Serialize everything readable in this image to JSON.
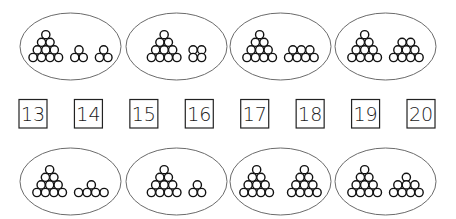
{
  "worksheet": {
    "task": "match-quantity-to-number",
    "colors": {
      "outline": "#6b6b6b",
      "circle_stroke": "#111111",
      "box_stroke": "#222222",
      "text": "#1a1a1a"
    },
    "numbers": [
      "13",
      "14",
      "15",
      "16",
      "17",
      "18",
      "19",
      "20"
    ],
    "top_sets": [
      {
        "total": 16,
        "groups": [
          {
            "shape": "triangle",
            "rows": [
              1,
              2,
              3,
              4
            ]
          },
          {
            "shape": "cluster",
            "rows": [
              1,
              2
            ]
          },
          {
            "shape": "cluster",
            "rows": [
              1,
              2
            ]
          }
        ]
      },
      {
        "total": 14,
        "groups": [
          {
            "shape": "triangle",
            "rows": [
              1,
              2,
              3,
              4
            ]
          },
          {
            "shape": "grid",
            "rows": [
              2,
              2
            ]
          }
        ]
      },
      {
        "total": 17,
        "groups": [
          {
            "shape": "triangle",
            "rows": [
              1,
              2,
              3,
              4
            ]
          },
          {
            "shape": "cluster",
            "rows": [
              3,
              4
            ]
          }
        ]
      },
      {
        "total": 19,
        "groups": [
          {
            "shape": "triangle",
            "rows": [
              1,
              2,
              3,
              4
            ]
          },
          {
            "shape": "cluster",
            "rows": [
              2,
              3,
              4
            ]
          }
        ]
      }
    ],
    "bottom_sets": [
      {
        "total": 15,
        "groups": [
          {
            "shape": "triangle",
            "rows": [
              1,
              2,
              3,
              4
            ]
          },
          {
            "shape": "cluster",
            "rows": [
              1,
              4
            ]
          }
        ]
      },
      {
        "total": 13,
        "groups": [
          {
            "shape": "triangle",
            "rows": [
              1,
              2,
              3,
              4
            ]
          },
          {
            "shape": "cluster",
            "rows": [
              1,
              2
            ]
          }
        ]
      },
      {
        "total": 20,
        "groups": [
          {
            "shape": "triangle",
            "rows": [
              1,
              2,
              3,
              4
            ]
          },
          {
            "shape": "triangle",
            "rows": [
              1,
              2,
              3,
              4
            ]
          }
        ]
      },
      {
        "total": 18,
        "groups": [
          {
            "shape": "triangle",
            "rows": [
              1,
              2,
              3,
              4
            ]
          },
          {
            "shape": "cluster",
            "rows": [
              1,
              3,
              4
            ]
          }
        ]
      }
    ]
  }
}
